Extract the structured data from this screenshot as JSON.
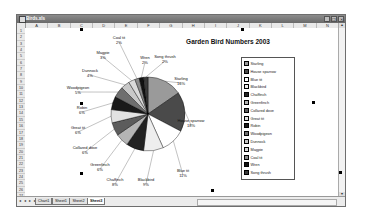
{
  "window": {
    "title": "Birds.xls",
    "buttons": [
      "minimize",
      "restore",
      "close"
    ]
  },
  "columns": [
    "A",
    "B",
    "C",
    "D",
    "E",
    "F",
    "G",
    "H",
    "I",
    "J",
    "K",
    "L",
    "M",
    "N"
  ],
  "rows": [
    "1",
    "2",
    "3",
    "4",
    "5",
    "6",
    "7",
    "8",
    "9",
    "10",
    "11",
    "12",
    "13",
    "14",
    "15",
    "16",
    "17",
    "18",
    "19",
    "20",
    "21",
    "22",
    "23",
    "24",
    "25",
    "26",
    "27"
  ],
  "sheet_tabs": {
    "nav": "◂ ◂ ▸ ▸",
    "tabs": [
      "Chart1",
      "Sheet1",
      "Sheet2",
      "Sheet3"
    ],
    "active": "Sheet3"
  },
  "chart_data": {
    "type": "pie",
    "title": "Garden Bird Numbers 2003",
    "legend_position": "right",
    "categories": [
      "Starling",
      "House sparrow",
      "Blue tit",
      "Blackbird",
      "Chaffinch",
      "Greenfinch",
      "Collared dove",
      "Great tit",
      "Robin",
      "Woodpigeon",
      "Dunnock",
      "Magpie",
      "Coal tit",
      "Wren",
      "Song thrush"
    ],
    "values": [
      16,
      18,
      11,
      9,
      8,
      6,
      6,
      6,
      6,
      5,
      4,
      3,
      2,
      2,
      2
    ],
    "data_labels": [
      "Starling\n16%",
      "House sparrow\n18%",
      "Blue tit\n11%",
      "Blackbird\n9%",
      "Chaffinch\n8%",
      "Greenfinch\n6%",
      "Collared dove\n6%",
      "Great tit\n6%",
      "Robin\n6%",
      "Woodpigeon\n5%",
      "Dunnock\n4%",
      "Magpie\n3%",
      "Coal tit\n2%",
      "Wren\n2%",
      "Song thrush\n2%"
    ],
    "colors": [
      "#9a9a9a",
      "#4a4a4a",
      "#ffffff",
      "#eeeeee",
      "#222222",
      "#b5b5b5",
      "#5c5c5c",
      "#e2e2e2",
      "#1a1a1a",
      "#6e6e6e",
      "#c8c8c8",
      "#dadada",
      "#8a8a8a",
      "#111111",
      "#3a3a3a"
    ]
  }
}
